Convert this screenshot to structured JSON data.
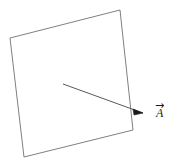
{
  "figure": {
    "background_color": "#ffffff",
    "stroke_color": "#808080",
    "arrow_color": "#595959",
    "label_color": "#1a1a1a",
    "width": 174,
    "height": 166,
    "caption": "",
    "surface": {
      "name": "quadrilateral surface",
      "stroke_width": 1,
      "fill": "none",
      "points": "10,38 120,10 133,130 24,157",
      "vertices": [
        {
          "label": "top-left",
          "x": 10,
          "y": 38
        },
        {
          "label": "top-right",
          "x": 120,
          "y": 10
        },
        {
          "label": "bottom-right",
          "x": 133,
          "y": 130
        },
        {
          "label": "bottom-left",
          "x": 24,
          "y": 157
        }
      ]
    },
    "vector": {
      "name": "vector A",
      "label_text": "A",
      "overarrow_glyph": "→",
      "stroke_width": 1,
      "start": {
        "x": 63,
        "y": 84
      },
      "end": {
        "x": 143,
        "y": 113
      },
      "head_points": "143,113 133,109 134,115"
    }
  }
}
